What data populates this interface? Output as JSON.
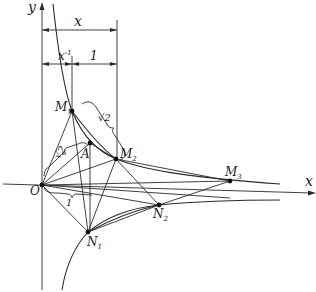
{
  "figure": {
    "axes": {
      "x_label": "x",
      "y_label": "y",
      "origin_label": "O"
    },
    "dimensions": {
      "top": "x",
      "inner_left": "x",
      "inner_left_sup": "-1",
      "inner_right": "1",
      "brace_m1_m2": "√2",
      "brace_o_a": "√2",
      "brace_o_n": "1"
    },
    "points": [
      {
        "name": "O",
        "label": "O",
        "sub": ""
      },
      {
        "name": "M1",
        "label": "M",
        "sub": "1"
      },
      {
        "name": "M2",
        "label": "M",
        "sub": "2"
      },
      {
        "name": "M3",
        "label": "M",
        "sub": "3"
      },
      {
        "name": "A",
        "label": "A",
        "sub": ""
      },
      {
        "name": "N1",
        "label": "N",
        "sub": "1"
      },
      {
        "name": "N2",
        "label": "N",
        "sub": "2"
      }
    ],
    "colors": {
      "ink": "#2a2a2a",
      "background": "#ffffff"
    }
  }
}
